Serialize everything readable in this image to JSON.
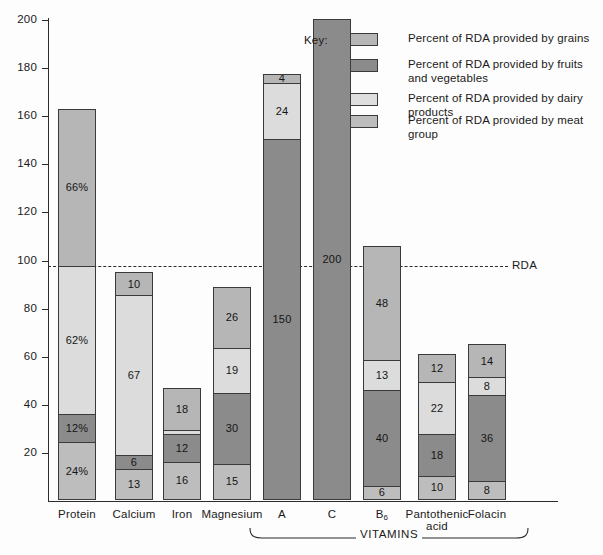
{
  "chart_data": {
    "type": "bar",
    "subtype": "stacked-bar",
    "title": "",
    "xlabel": "",
    "ylabel": "",
    "ylim": [
      0,
      200
    ],
    "yticks": [
      20,
      40,
      60,
      80,
      100,
      120,
      140,
      160,
      180,
      200
    ],
    "ytick_labels": [
      "20",
      "40",
      "60",
      "80",
      "100",
      "120",
      "140",
      "160",
      "180",
      "200"
    ],
    "grid": false,
    "categories": [
      "Protein",
      "Calcium",
      "Iron",
      "Magnesium",
      "A",
      "C",
      "B₆",
      "Pantothenic acid",
      "Folacin"
    ],
    "group_bracket": {
      "label": "VITAMINS",
      "spans": [
        "A",
        "C",
        "B₆",
        "Pantothenic acid",
        "Folacin"
      ]
    },
    "reference_line": {
      "value": 100,
      "label": "RDA",
      "style": "dashed"
    },
    "series": [
      {
        "name": "Percent of RDA provided by meat group",
        "key": "meat",
        "color": "#bdbdbd",
        "values": [
          24,
          13,
          16,
          15,
          0,
          0,
          6,
          10,
          8
        ],
        "labels": [
          "24%",
          "13",
          "16",
          "15",
          "",
          "",
          "6",
          "10",
          "8"
        ]
      },
      {
        "name": "Percent of RDA provided by fruits and vegetables",
        "key": "fruits",
        "color": "#8b8b8b",
        "values": [
          12,
          6,
          12,
          30,
          150,
          200,
          40,
          18,
          36
        ],
        "labels": [
          "12%",
          "6",
          "12",
          "30",
          "150",
          "200",
          "40",
          "18",
          "36"
        ]
      },
      {
        "name": "Percent of RDA provided by dairy products",
        "key": "dairy",
        "color": "#dcdcdc",
        "values": [
          62,
          67,
          2,
          19,
          24,
          0,
          13,
          22,
          8
        ],
        "labels": [
          "62%",
          "67",
          "",
          "19",
          "24",
          "",
          "13",
          "22",
          "8"
        ]
      },
      {
        "name": "Percent of RDA provided by grains",
        "key": "grains",
        "color": "#b6b6b6",
        "values": [
          66,
          10,
          18,
          26,
          4,
          0,
          48,
          12,
          14
        ],
        "labels": [
          "66%",
          "10",
          "18",
          "26",
          "4",
          "",
          "48",
          "12",
          "14"
        ]
      }
    ],
    "totals": [
      164,
      96,
      48,
      90,
      178,
      200,
      107,
      62,
      66
    ]
  },
  "legend": {
    "title": "Key:",
    "position": "top-right",
    "entries": [
      {
        "swatch": "grains",
        "text": "Percent of RDA provided by grains"
      },
      {
        "swatch": "fruits",
        "text": "Percent of RDA provided by fruits\nand vegetables"
      },
      {
        "swatch": "dairy",
        "text": "Percent of RDA provided by dairy products"
      },
      {
        "swatch": "meat",
        "text": "Percent of RDA provided by meat group"
      }
    ]
  },
  "axis": {
    "rda_label": "RDA",
    "ticks": [
      "200",
      "180",
      "160",
      "140",
      "120",
      "100",
      "80",
      "60",
      "40",
      "20"
    ]
  },
  "categories": {
    "protein": "Protein",
    "calcium": "Calcium",
    "iron": "Iron",
    "magnesium": "Magnesium",
    "vitamin_a": "A",
    "vitamin_c": "C",
    "vitamin_b6_base": "B",
    "vitamin_b6_sub": "6",
    "pantothenic_line1": "Pantothenic",
    "pantothenic_line2": "acid",
    "folacin": "Folacin",
    "vitamins_bracket": "VITAMINS"
  }
}
